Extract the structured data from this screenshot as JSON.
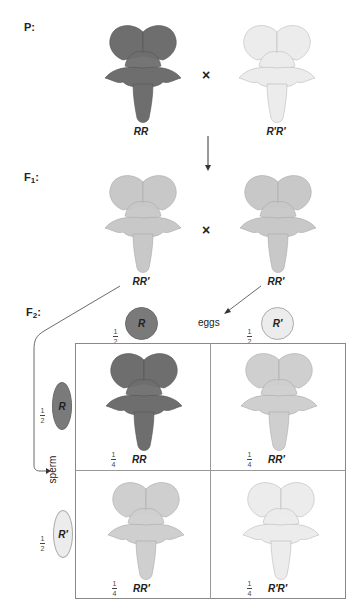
{
  "generations": {
    "p": {
      "label": "P:"
    },
    "f1": {
      "label": "F",
      "sub": "1",
      "suffix": ":"
    },
    "f2": {
      "label": "F",
      "sub": "2",
      "suffix": ":"
    }
  },
  "parents": {
    "left": {
      "genotype": "RR",
      "color": "#6e6e6e"
    },
    "right": {
      "genotype": "R′R′",
      "color": "#e6e6e6"
    },
    "cross_symbol": "×"
  },
  "f1": {
    "left": {
      "genotype": "RR′",
      "color": "#c4c4c4"
    },
    "right": {
      "genotype": "RR′",
      "color": "#c4c4c4"
    },
    "cross_symbol": "×"
  },
  "gametes": {
    "eggs_label": "eggs",
    "sperm_label": "sperm",
    "eggs": [
      {
        "num": "1",
        "den": "2",
        "allele": "R",
        "color": "#7a7a7a"
      },
      {
        "num": "1",
        "den": "2",
        "allele": "R′",
        "color": "#ececec"
      }
    ],
    "sperm": [
      {
        "num": "1",
        "den": "2",
        "allele": "R",
        "color": "#7a7a7a"
      },
      {
        "num": "1",
        "den": "2",
        "allele": "R′",
        "color": "#ececec"
      }
    ]
  },
  "punnett": {
    "cells": [
      {
        "num": "1",
        "den": "4",
        "genotype": "RR",
        "color": "#6e6e6e"
      },
      {
        "num": "1",
        "den": "4",
        "genotype": "RR′",
        "color": "#c4c4c4"
      },
      {
        "num": "1",
        "den": "4",
        "genotype": "RR′",
        "color": "#c4c4c4"
      },
      {
        "num": "1",
        "den": "4",
        "genotype": "R′R′",
        "color": "#e6e6e6"
      }
    ]
  }
}
